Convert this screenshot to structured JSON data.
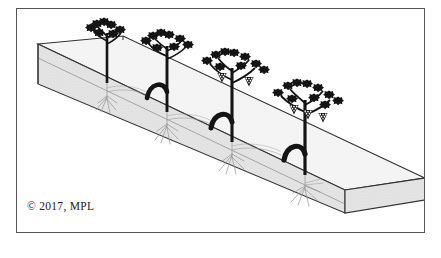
{
  "figure": {
    "caption": "© 2017, MPL",
    "copyright_symbol": "©",
    "copyright_year": "2017",
    "copyright_holder": "MPL",
    "frame": {
      "border_color": "#555555",
      "background_color": "#ffffff",
      "x": 16,
      "y": 8,
      "width": 409,
      "height": 225
    },
    "colors": {
      "ink": "#1a1a1a",
      "line": "#333333",
      "soil_fill": "#e3e3e3",
      "soil_top_fill": "#f2f2f2",
      "root_line": "#8a8a8a",
      "frame": "#555555",
      "page_background": "#ffffff"
    },
    "soil_block": {
      "name": "isometric-soil-bed",
      "description": "Long rectangular block of soil drawn in isometric projection receding from upper-left to lower-right",
      "fill": "#e3e3e3",
      "texture": "fine stipple"
    },
    "plants": [
      {
        "index": 1,
        "name": "young-vine-no-fruit",
        "stage_label": "Newly planted vine",
        "has_grapes": false,
        "grape_clusters": 0,
        "has_cordon_arch": false,
        "leaf_count": 7,
        "root_depth": "shallow"
      },
      {
        "index": 2,
        "name": "established-vine-arched-trunk",
        "stage_label": "Established vine with arched trunk",
        "has_grapes": false,
        "grape_clusters": 0,
        "has_cordon_arch": true,
        "leaf_count": 8,
        "root_depth": "medium"
      },
      {
        "index": 3,
        "name": "fruiting-vine-two-clusters",
        "stage_label": "Fruiting vine",
        "has_grapes": true,
        "grape_clusters": 2,
        "has_cordon_arch": true,
        "leaf_count": 9,
        "root_depth": "deep"
      },
      {
        "index": 4,
        "name": "mature-fruiting-vine",
        "stage_label": "Mature fruiting vine",
        "has_grapes": true,
        "grape_clusters": 3,
        "has_cordon_arch": true,
        "leaf_count": 10,
        "root_depth": "deep"
      }
    ],
    "plant_count": 4
  }
}
